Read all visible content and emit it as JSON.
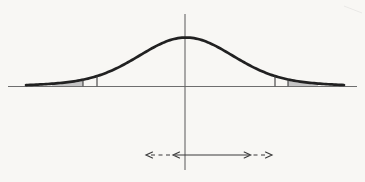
{
  "diagram": {
    "type": "normal-distribution-curve-with-shaded-tails",
    "background_color": "#f8f7f4",
    "curve": {
      "color": "#212121",
      "stroke_width": 2.7,
      "center_x": 186,
      "baseline_y": 86.5,
      "core_amp": 41,
      "core_sigma": 45,
      "tail_amp": 8,
      "tail_sigma": 85,
      "x_start": 26,
      "x_end": 344
    },
    "baseline": {
      "color": "#6e6e6e",
      "stroke_width": 1.2,
      "x1": 8,
      "x2": 357,
      "y": 86.5
    },
    "mean_line": {
      "color": "#666666",
      "stroke_width": 1.1,
      "x": 185,
      "y1": 14,
      "y2": 170
    },
    "cutoff_lines": {
      "color": "#3c3c3c",
      "stroke_width": 1.1,
      "left_x": [
        83,
        97
      ],
      "right_x": [
        275,
        288
      ]
    },
    "shaded_tails": {
      "color": "#c4c4c4",
      "left": [
        52,
        83
      ],
      "right": [
        288,
        318
      ]
    },
    "spread_arrows": {
      "color": "#3a3a3a",
      "stroke_width": 1.15,
      "y": 155,
      "solid": [
        175,
        249
      ],
      "inner_left_tip": 173,
      "inner_right_tip": 250.7,
      "left_dashed": [
        151,
        170
      ],
      "right_dashed": [
        253.5,
        266.5
      ],
      "outer_left_tip": 146,
      "outer_right_tip": 272,
      "dash_pattern": "4 3.5",
      "head_length": 6.5,
      "head_half_width": 3
    },
    "scan_smudge": {
      "color": "#bbbbbb",
      "opacity": 0.3,
      "x1": 344,
      "y1": 6,
      "x2": 362,
      "y2": 13
    }
  }
}
